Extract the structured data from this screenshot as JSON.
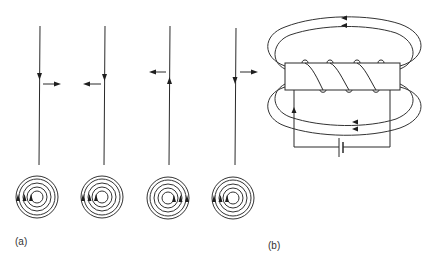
{
  "figure": {
    "panel_a": {
      "label": "(a)",
      "wires": [
        {
          "id": 1,
          "x": 40,
          "current_direction": "down",
          "force_direction": "right"
        },
        {
          "id": 2,
          "x": 105,
          "current_direction": "down",
          "force_direction": "left"
        },
        {
          "id": 3,
          "x": 170,
          "current_direction": "up",
          "force_direction": "left"
        },
        {
          "id": 4,
          "x": 236,
          "current_direction": "down",
          "force_direction": "right"
        }
      ],
      "field_rings": [
        {
          "id": 1,
          "cx": 37,
          "cy": 197,
          "arrows_side": "left",
          "arrow_direction": "up"
        },
        {
          "id": 2,
          "cx": 102,
          "cy": 197,
          "arrows_side": "left",
          "arrow_direction": "up"
        },
        {
          "id": 3,
          "cx": 168,
          "cy": 198,
          "arrows_side": "right",
          "arrow_direction": "up"
        },
        {
          "id": 4,
          "cx": 233,
          "cy": 198,
          "arrows_side": "left",
          "arrow_direction": "up"
        }
      ]
    },
    "panel_b": {
      "label": "(b)",
      "description": "Solenoid coil with magnetic field loops and battery circuit",
      "field_loop_arrow_direction": "left",
      "circuit_arrow_direction": "up"
    }
  }
}
